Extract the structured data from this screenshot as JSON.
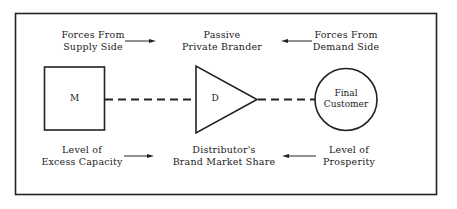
{
  "diagram": {
    "title": "",
    "top_row": {
      "left": {
        "line1": "Forces From",
        "line2": "Supply Side",
        "arrow": "right"
      },
      "center": {
        "line1": "Passive",
        "line2": "Private Brander"
      },
      "right": {
        "line1": "Forces From",
        "line2": "Demand Side",
        "arrow": "left"
      }
    },
    "nodes": {
      "manufacturer": {
        "shape": "square",
        "label": "M"
      },
      "distributor": {
        "shape": "triangle",
        "label": "D"
      },
      "customer": {
        "shape": "circle",
        "line1": "Final",
        "line2": "Customer"
      }
    },
    "connectors": [
      {
        "from": "manufacturer",
        "to": "distributor",
        "style": "dashed"
      },
      {
        "from": "distributor",
        "to": "customer",
        "style": "dashed"
      }
    ],
    "bottom_row": {
      "left": {
        "line1": "Level of",
        "line2": "Excess Capacity",
        "arrow": "right"
      },
      "center": {
        "line1": "Distributor's",
        "line2": "Brand Market Share"
      },
      "right": {
        "line1": "Level of",
        "line2": "Prosperity",
        "arrow": "left"
      }
    },
    "colors": {
      "stroke": "#222222",
      "background": "#ffffff"
    }
  }
}
